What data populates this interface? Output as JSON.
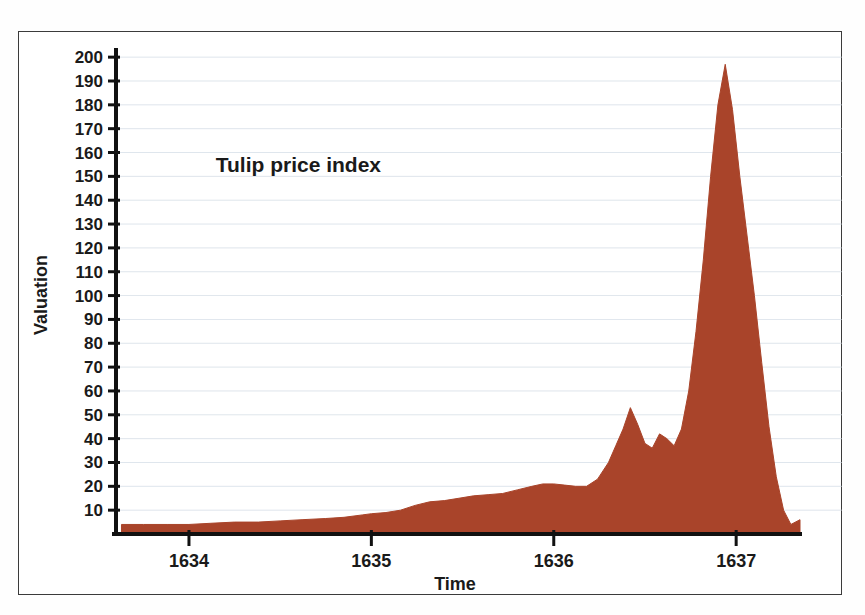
{
  "chart_data": {
    "type": "area",
    "title": "Tulip price index",
    "xlabel": "Time",
    "ylabel": "Valuation",
    "grid": true,
    "legend": "none",
    "fill_color": "#A9442A",
    "gridline_color": "#C9D4E0",
    "axis_color": "#111111",
    "xlim": [
      1633.6,
      1637.35
    ],
    "ylim": [
      0,
      203
    ],
    "xticks": [
      1634,
      1635,
      1636,
      1637
    ],
    "xtick_labels": [
      "1634",
      "1635",
      "1636",
      "1637"
    ],
    "yticks": [
      10,
      20,
      30,
      40,
      50,
      60,
      70,
      80,
      90,
      100,
      110,
      120,
      130,
      140,
      150,
      160,
      170,
      180,
      190,
      200
    ],
    "ytick_labels": [
      "10",
      "20",
      "30",
      "40",
      "50",
      "60",
      "70",
      "80",
      "90",
      "100",
      "110",
      "120",
      "130",
      "140",
      "150",
      "160",
      "170",
      "180",
      "190",
      "200"
    ],
    "x": [
      1633.63,
      1633.75,
      1633.88,
      1634.0,
      1634.12,
      1634.25,
      1634.38,
      1634.5,
      1634.62,
      1634.75,
      1634.85,
      1634.95,
      1635.0,
      1635.08,
      1635.16,
      1635.24,
      1635.32,
      1635.4,
      1635.48,
      1635.56,
      1635.64,
      1635.72,
      1635.8,
      1635.88,
      1635.94,
      1636.0,
      1636.06,
      1636.12,
      1636.18,
      1636.24,
      1636.3,
      1636.34,
      1636.38,
      1636.42,
      1636.46,
      1636.5,
      1636.54,
      1636.58,
      1636.62,
      1636.66,
      1636.7,
      1636.74,
      1636.78,
      1636.82,
      1636.86,
      1636.9,
      1636.94,
      1636.98,
      1637.02,
      1637.06,
      1637.1,
      1637.14,
      1637.18,
      1637.22,
      1637.26,
      1637.3,
      1637.35
    ],
    "y": [
      4,
      4,
      4,
      4,
      4.5,
      5,
      5,
      5.5,
      6,
      6.5,
      7,
      8,
      8.5,
      9,
      10,
      12,
      13.5,
      14,
      15,
      16,
      16.5,
      17,
      18.5,
      20,
      21,
      21,
      20.5,
      20,
      20,
      23,
      30,
      37,
      44,
      53,
      46,
      38,
      36,
      42,
      40,
      37,
      44,
      60,
      85,
      115,
      150,
      180,
      197,
      178,
      150,
      125,
      100,
      72,
      45,
      24,
      10,
      4,
      6
    ],
    "annotations": [
      {
        "text": "Tulip price index",
        "x": 1634.6,
        "y": 152
      }
    ],
    "notes": {
      "primary_peak_value": 197,
      "primary_peak_x": 1636.94,
      "secondary_peak_value": 53,
      "secondary_peak_x": 1636.42,
      "crash_low_value": 4,
      "crash_low_x": 1637.3,
      "start_value": 4
    }
  }
}
